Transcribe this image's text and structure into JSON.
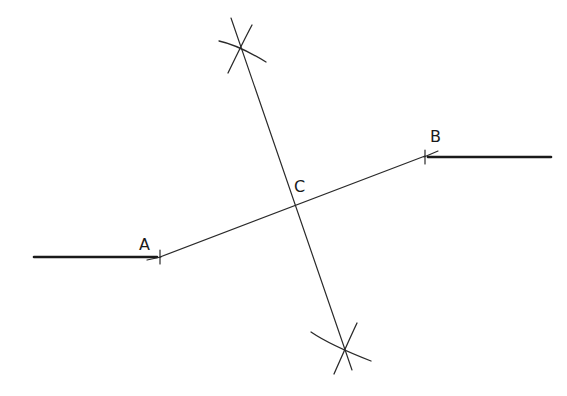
{
  "diagram": {
    "background": "#ffffff",
    "line_color": "#1a1a1a",
    "points": {
      "A": {
        "label": "A",
        "x": 160,
        "y": 257,
        "label_x": 139,
        "label_y": 250
      },
      "B": {
        "label": "B",
        "x": 425,
        "y": 156,
        "label_x": 430,
        "label_y": 141
      },
      "C": {
        "label": "C",
        "x": 292,
        "y": 205,
        "label_x": 294,
        "label_y": 192
      }
    },
    "segments": [
      {
        "name": "segment-AB",
        "x1": 160,
        "y1": 257,
        "x2": 425,
        "y2": 156,
        "style": "thin"
      },
      {
        "name": "perpendicular-bisector",
        "x1": 237,
        "y1": 45,
        "x2": 346,
        "y2": 352,
        "style": "thin"
      },
      {
        "name": "left-thick-line",
        "x1": 34,
        "y1": 257,
        "x2": 160,
        "y2": 257,
        "style": "thick"
      },
      {
        "name": "right-thick-line",
        "x1": 425,
        "y1": 157,
        "x2": 551,
        "y2": 157,
        "style": "thick"
      }
    ],
    "arc_intersections": [
      {
        "name": "top-arc-intersection",
        "x": 237,
        "y": 45
      },
      {
        "name": "bottom-arc-intersection",
        "x": 346,
        "y": 352
      }
    ]
  }
}
